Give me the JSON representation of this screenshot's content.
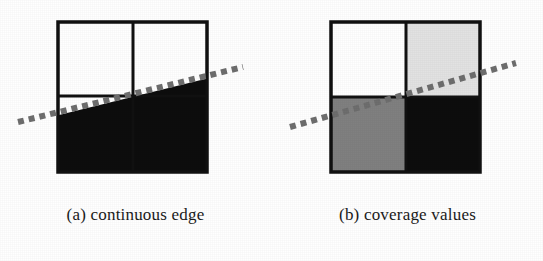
{
  "figure": {
    "background_color": "#ffffff",
    "width": 543,
    "height": 261
  },
  "panels": [
    {
      "id": "a",
      "caption": "(a) continuous edge",
      "square": {
        "x": 58,
        "y": 22,
        "size": 149,
        "border_color": "#111111",
        "border_width": 3,
        "grid_x": 133,
        "grid_y": 96,
        "grid_color": "#111111",
        "grid_width": 3
      },
      "fill": {
        "description": "solid black region below a straight edge",
        "color": "#0d0d0d",
        "above_color": "#ffffff"
      },
      "edge_line": {
        "x1": 18,
        "y1": 122,
        "x2": 243,
        "y2": 67,
        "style": "dashed",
        "color": "#6e6e6e",
        "dash_length": 6,
        "dash_gap": 5,
        "width": 6
      }
    },
    {
      "id": "b",
      "caption": "(b) coverage values",
      "square": {
        "x": 59,
        "y": 22,
        "size": 149,
        "border_color": "#111111",
        "border_width": 3,
        "grid_x": 134,
        "grid_y": 97,
        "grid_color": "#111111",
        "grid_width": 3
      },
      "quadrants": [
        {
          "name": "top-left",
          "coverage": "0",
          "color": "#ffffff"
        },
        {
          "name": "top-right",
          "coverage": "0.25",
          "color": "#e2e2e2"
        },
        {
          "name": "bottom-left",
          "coverage": "0.5",
          "color": "#808080"
        },
        {
          "name": "bottom-right",
          "coverage": "1",
          "color": "#0d0d0d"
        }
      ],
      "edge_line": {
        "x1": 18,
        "y1": 127,
        "x2": 244,
        "y2": 63,
        "style": "dashed",
        "color": "#6e6e6e",
        "dash_length": 6,
        "dash_gap": 5,
        "width": 6
      }
    }
  ]
}
